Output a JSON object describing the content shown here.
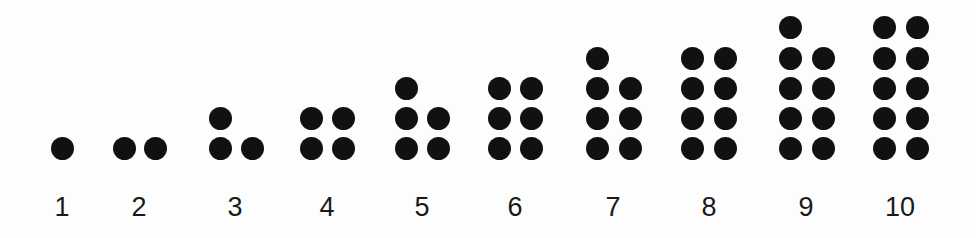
{
  "diagram": {
    "title": "",
    "dot_color": "#111111",
    "background_color": "#fdfdfd",
    "groups": [
      {
        "label": "1",
        "count": 1,
        "center_x": 62,
        "columns": [
          {
            "x": 62,
            "dots": 1
          }
        ]
      },
      {
        "label": "2",
        "count": 2,
        "center_x": 139,
        "columns": [
          {
            "x": 124,
            "dots": 1
          },
          {
            "x": 155,
            "dots": 1
          }
        ]
      },
      {
        "label": "3",
        "count": 3,
        "center_x": 235,
        "columns": [
          {
            "x": 220,
            "dots": 2
          },
          {
            "x": 252,
            "dots": 1
          }
        ]
      },
      {
        "label": "4",
        "count": 4,
        "center_x": 327,
        "columns": [
          {
            "x": 311,
            "dots": 2
          },
          {
            "x": 343,
            "dots": 2
          }
        ]
      },
      {
        "label": "5",
        "count": 5,
        "center_x": 422,
        "columns": [
          {
            "x": 406,
            "dots": 3
          },
          {
            "x": 438,
            "dots": 2
          }
        ]
      },
      {
        "label": "6",
        "count": 6,
        "center_x": 515,
        "columns": [
          {
            "x": 499,
            "dots": 3
          },
          {
            "x": 531,
            "dots": 3
          }
        ]
      },
      {
        "label": "7",
        "count": 7,
        "center_x": 613,
        "columns": [
          {
            "x": 597,
            "dots": 4
          },
          {
            "x": 630,
            "dots": 3
          }
        ]
      },
      {
        "label": "8",
        "count": 8,
        "center_x": 709,
        "columns": [
          {
            "x": 692,
            "dots": 4
          },
          {
            "x": 725,
            "dots": 4
          }
        ]
      },
      {
        "label": "9",
        "count": 9,
        "center_x": 806,
        "columns": [
          {
            "x": 790,
            "dots": 5
          },
          {
            "x": 823,
            "dots": 4
          }
        ]
      },
      {
        "label": "10",
        "count": 10,
        "center_x": 900,
        "columns": [
          {
            "x": 884,
            "dots": 5
          },
          {
            "x": 917,
            "dots": 5
          }
        ]
      }
    ],
    "row_centers_y": [
      148,
      118,
      88,
      58,
      27
    ]
  },
  "labels": [
    "1",
    "2",
    "3",
    "4",
    "5",
    "6",
    "7",
    "8",
    "9",
    "10"
  ]
}
